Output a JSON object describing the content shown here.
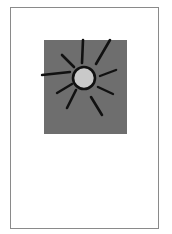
{
  "page": {
    "border_color": "#8a8a8a",
    "background": "#ffffff"
  },
  "illustration": {
    "subject": "sun",
    "panel_color": "#6e6e6e",
    "sun_fill": "#c9c9c9",
    "stroke_color": "#111111",
    "icon": "sun-icon"
  }
}
